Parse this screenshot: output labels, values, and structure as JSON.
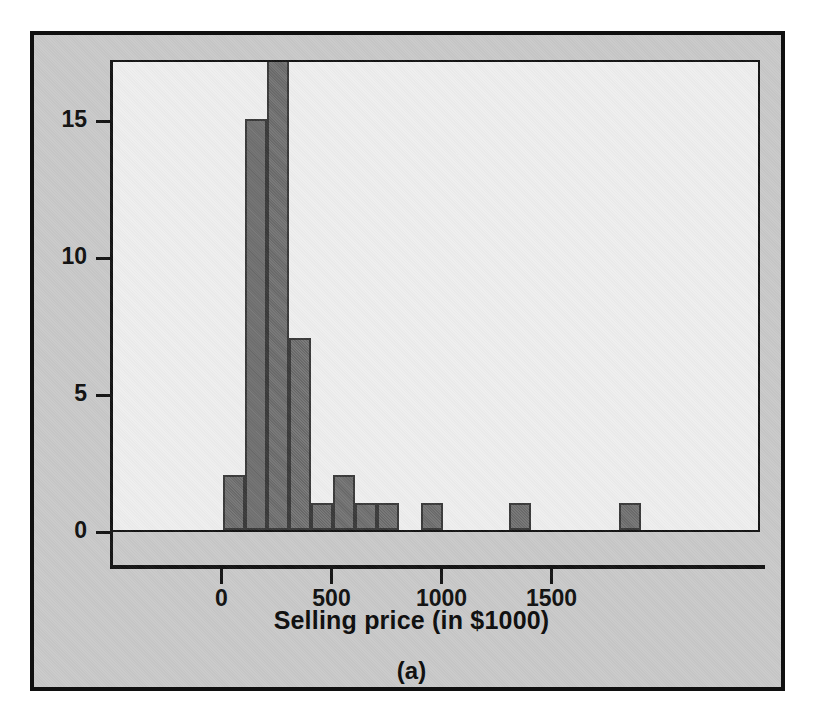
{
  "figure": {
    "panel_caption": "(a)",
    "frame_color": "#101010",
    "margin_color": "#c9c9c9",
    "plot_background": "#eeeeee",
    "bar_color": "#6f6f6f",
    "bar_edge_color": "#3a3a3a"
  },
  "chart_data": {
    "type": "bar",
    "title": "",
    "subtitle": "",
    "xlabel": "Selling price (in $1000)",
    "ylabel": "",
    "grid": false,
    "legend": null,
    "xlim": [
      -100,
      1950
    ],
    "ylim": [
      0,
      19
    ],
    "xticks": [
      0,
      500,
      1000,
      1500
    ],
    "xticklabels": [
      "0",
      "500",
      "1000",
      "1500"
    ],
    "yticks": [
      0,
      5,
      10,
      15
    ],
    "yticklabels": [
      "0",
      "5",
      "10",
      "15"
    ],
    "bin_width": 100,
    "bins": [
      {
        "x0": 0,
        "x1": 100,
        "count": 2
      },
      {
        "x0": 100,
        "x1": 200,
        "count": 15
      },
      {
        "x0": 200,
        "x1": 300,
        "count": 18
      },
      {
        "x0": 300,
        "x1": 400,
        "count": 7
      },
      {
        "x0": 400,
        "x1": 500,
        "count": 1
      },
      {
        "x0": 500,
        "x1": 600,
        "count": 2
      },
      {
        "x0": 600,
        "x1": 700,
        "count": 1
      },
      {
        "x0": 700,
        "x1": 800,
        "count": 1
      },
      {
        "x0": 800,
        "x1": 900,
        "count": 0
      },
      {
        "x0": 900,
        "x1": 1000,
        "count": 1
      },
      {
        "x0": 1000,
        "x1": 1100,
        "count": 0
      },
      {
        "x0": 1100,
        "x1": 1200,
        "count": 0
      },
      {
        "x0": 1200,
        "x1": 1300,
        "count": 0
      },
      {
        "x0": 1300,
        "x1": 1400,
        "count": 1
      },
      {
        "x0": 1400,
        "x1": 1500,
        "count": 0
      },
      {
        "x0": 1500,
        "x1": 1600,
        "count": 0
      },
      {
        "x0": 1600,
        "x1": 1700,
        "count": 0
      },
      {
        "x0": 1700,
        "x1": 1800,
        "count": 0
      },
      {
        "x0": 1800,
        "x1": 1900,
        "count": 1
      }
    ],
    "categories": [
      "0-100",
      "100-200",
      "200-300",
      "300-400",
      "400-500",
      "500-600",
      "600-700",
      "700-800",
      "800-900",
      "900-1000",
      "1000-1100",
      "1100-1200",
      "1200-1300",
      "1300-1400",
      "1400-1500",
      "1500-1600",
      "1600-1700",
      "1700-1800",
      "1800-1900"
    ],
    "values": [
      2,
      15,
      18,
      7,
      1,
      2,
      1,
      1,
      0,
      1,
      0,
      0,
      0,
      1,
      0,
      0,
      0,
      0,
      1
    ]
  }
}
